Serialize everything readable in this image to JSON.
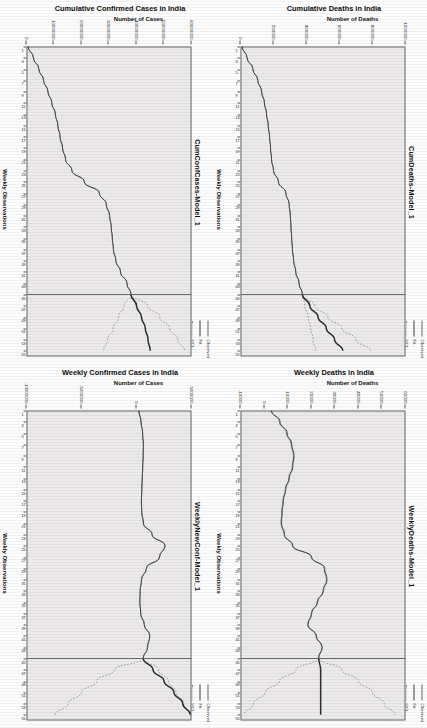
{
  "page": {
    "orientation": "rotated-90",
    "background": "#fdfdfd",
    "panel_fill": "#eceaea",
    "axis_color": "#6a6a6a",
    "observed_color": "#6b6b6b",
    "fit_color": "#3b3b3b",
    "limit_color": "#8a8a8a",
    "forecast_color": "#2b2b2b"
  },
  "legend": {
    "items": [
      {
        "label": "Observed",
        "style": "solid",
        "icon": "line-swatch-observed"
      },
      {
        "label": "Fit",
        "style": "solid",
        "icon": "line-swatch-fit"
      },
      {
        "label": "UCL",
        "style": "dotted",
        "icon": "line-swatch-ucl"
      },
      {
        "label": "LCL",
        "style": "dotted",
        "icon": "line-swatch-lcl"
      },
      {
        "label": "Forecast",
        "style": "thick-solid",
        "icon": "line-swatch-forecast"
      }
    ]
  },
  "chart_data": [
    {
      "id": "cum-conf-cases",
      "type": "line",
      "title": "CumConfCases-Model_1",
      "supertitle": "Cumulative Confirmed Cases in India",
      "xlabel": "Weekly Observations",
      "ylabel": "Number of Cases",
      "xlim": [
        1,
        56
      ],
      "ylim": [
        0,
        60000000
      ],
      "ytick_labels": [
        "0",
        "10000000",
        "20000000",
        "30000000",
        "40000000",
        "50000000",
        "60000000"
      ],
      "ytick_values": [
        0,
        10000000,
        20000000,
        30000000,
        40000000,
        50000000,
        60000000
      ],
      "xtick_labels": [
        "1",
        "3",
        "5",
        "7",
        "9",
        "11",
        "13",
        "15",
        "17",
        "19",
        "21",
        "23",
        "25",
        "27",
        "29",
        "31",
        "33",
        "35",
        "37",
        "39",
        "41",
        "43",
        "45",
        "47",
        "49",
        "51",
        "53",
        "55"
      ],
      "forecast_start": 45,
      "grid": false,
      "legend_position": "top-right",
      "series": [
        {
          "name": "Observed",
          "x": [
            1,
            3,
            5,
            7,
            9,
            11,
            13,
            15,
            17,
            19,
            21,
            23,
            25,
            27,
            29,
            31,
            33,
            35,
            37,
            39,
            41,
            43,
            45
          ],
          "values": [
            600000,
            2500000,
            4500000,
            6200000,
            7800000,
            9200000,
            10500000,
            11400000,
            12200000,
            13100000,
            14200000,
            16500000,
            21000000,
            26500000,
            29000000,
            30200000,
            30800000,
            31200000,
            31600000,
            32500000,
            34200000,
            36500000,
            38000000
          ]
        },
        {
          "name": "Fit",
          "x": [
            1,
            3,
            5,
            7,
            9,
            11,
            13,
            15,
            17,
            19,
            21,
            23,
            25,
            27,
            29,
            31,
            33,
            35,
            37,
            39,
            41,
            43,
            45
          ],
          "values": [
            600000,
            2500000,
            4500000,
            6200000,
            7800000,
            9200000,
            10500000,
            11400000,
            12200000,
            13100000,
            14200000,
            16500000,
            21000000,
            26500000,
            29000000,
            30200000,
            30800000,
            31200000,
            31600000,
            32500000,
            34200000,
            36500000,
            38000000
          ]
        },
        {
          "name": "Forecast",
          "x": [
            45,
            47,
            49,
            51,
            53,
            55
          ],
          "values": [
            38000000,
            40000000,
            41800000,
            43200000,
            44200000,
            45000000
          ]
        },
        {
          "name": "UCL",
          "x": [
            45,
            47,
            49,
            51,
            53,
            55
          ],
          "values": [
            38000000,
            44000000,
            48500000,
            52000000,
            55000000,
            57500000
          ]
        },
        {
          "name": "LCL",
          "x": [
            45,
            47,
            49,
            51,
            53,
            55
          ],
          "values": [
            38000000,
            35500000,
            33500000,
            31500000,
            29500000,
            28000000
          ]
        }
      ]
    },
    {
      "id": "cum-deaths",
      "type": "line",
      "title": "CumDeaths-Model_1",
      "supertitle": "Cumulative Deaths in India",
      "xlabel": "Weekly Observations",
      "ylabel": "Number of Deaths",
      "xlim": [
        1,
        56
      ],
      "ylim": [
        0,
        1000000
      ],
      "ytick_labels": [
        "0",
        "200000",
        "400000",
        "600000",
        "800000",
        "1000000"
      ],
      "ytick_values": [
        0,
        200000,
        400000,
        600000,
        800000,
        1000000
      ],
      "xtick_labels": [
        "1",
        "3",
        "5",
        "7",
        "9",
        "11",
        "13",
        "15",
        "17",
        "19",
        "21",
        "23",
        "25",
        "27",
        "29",
        "31",
        "33",
        "35",
        "37",
        "39",
        "41",
        "43",
        "45",
        "47",
        "49",
        "51",
        "53",
        "55"
      ],
      "forecast_start": 45,
      "grid": false,
      "legend_position": "top-right",
      "series": [
        {
          "name": "Observed",
          "x": [
            1,
            3,
            5,
            7,
            9,
            11,
            13,
            15,
            17,
            19,
            21,
            23,
            25,
            27,
            29,
            31,
            33,
            35,
            37,
            39,
            41,
            43,
            45
          ],
          "values": [
            10000,
            40000,
            75000,
            105000,
            128000,
            145000,
            158000,
            168000,
            176000,
            182000,
            188000,
            200000,
            230000,
            275000,
            295000,
            302000,
            306000,
            310000,
            315000,
            322000,
            335000,
            355000,
            375000
          ]
        },
        {
          "name": "Fit",
          "x": [
            1,
            3,
            5,
            7,
            9,
            11,
            13,
            15,
            17,
            19,
            21,
            23,
            25,
            27,
            29,
            31,
            33,
            35,
            37,
            39,
            41,
            43,
            45
          ],
          "values": [
            10000,
            40000,
            75000,
            105000,
            128000,
            145000,
            158000,
            168000,
            176000,
            182000,
            188000,
            200000,
            230000,
            275000,
            295000,
            302000,
            306000,
            310000,
            315000,
            322000,
            335000,
            355000,
            375000
          ]
        },
        {
          "name": "Forecast",
          "x": [
            45,
            47,
            49,
            51,
            53,
            55
          ],
          "values": [
            375000,
            420000,
            470000,
            520000,
            570000,
            620000
          ]
        },
        {
          "name": "UCL",
          "x": [
            45,
            47,
            49,
            51,
            53,
            55
          ],
          "values": [
            375000,
            450000,
            530000,
            615000,
            700000,
            790000
          ]
        },
        {
          "name": "LCL",
          "x": [
            45,
            47,
            49,
            51,
            53,
            55
          ],
          "values": [
            375000,
            390000,
            410000,
            425000,
            440000,
            455000
          ]
        }
      ]
    },
    {
      "id": "weekly-new-conf",
      "type": "line",
      "title": "WeeklyNewConf-Model_1",
      "supertitle": "Weekly Confirmed Cases in India",
      "xlabel": "Weekly Observations",
      "ylabel": "Number of Cases",
      "xlim": [
        1,
        56
      ],
      "ylim": [
        -10000000,
        5000000
      ],
      "ytick_labels": [
        "5000000",
        "0",
        "-5000000",
        "-10000000"
      ],
      "ytick_values": [
        5000000,
        0,
        -5000000,
        -10000000
      ],
      "xtick_labels": [
        "1",
        "3",
        "5",
        "7",
        "9",
        "11",
        "13",
        "15",
        "17",
        "19",
        "21",
        "23",
        "25",
        "27",
        "29",
        "31",
        "33",
        "35",
        "37",
        "39",
        "41",
        "43",
        "45",
        "47",
        "49",
        "51",
        "53",
        "55"
      ],
      "forecast_start": 45,
      "grid": false,
      "legend_position": "top-right",
      "series": [
        {
          "name": "Observed",
          "x": [
            1,
            3,
            5,
            7,
            9,
            11,
            13,
            15,
            17,
            19,
            21,
            23,
            25,
            27,
            29,
            31,
            33,
            35,
            37,
            39,
            41,
            43,
            45
          ],
          "values": [
            200000,
            400000,
            550000,
            620000,
            600000,
            560000,
            520000,
            480000,
            440000,
            470000,
            620000,
            1400000,
            2600000,
            2100000,
            900000,
            450000,
            330000,
            300000,
            380000,
            700000,
            1200000,
            1000000,
            600000
          ]
        },
        {
          "name": "Fit",
          "x": [
            1,
            3,
            5,
            7,
            9,
            11,
            13,
            15,
            17,
            19,
            21,
            23,
            25,
            27,
            29,
            31,
            33,
            35,
            37,
            39,
            41,
            43,
            45
          ],
          "values": [
            230000,
            420000,
            560000,
            630000,
            610000,
            570000,
            525000,
            485000,
            450000,
            480000,
            630000,
            1420000,
            2580000,
            2080000,
            905000,
            460000,
            335000,
            305000,
            385000,
            710000,
            1210000,
            1010000,
            610000
          ]
        },
        {
          "name": "Forecast",
          "x": [
            45,
            47,
            49,
            51,
            53,
            55
          ],
          "values": [
            610000,
            1500000,
            2500000,
            3400000,
            4200000,
            4900000
          ]
        },
        {
          "name": "UCL",
          "x": [
            45,
            47,
            49,
            51,
            53,
            55
          ],
          "values": [
            610000,
            2000000,
            2900000,
            3600000,
            4300000,
            4950000
          ]
        },
        {
          "name": "LCL",
          "x": [
            45,
            47,
            49,
            51,
            53,
            55
          ],
          "values": [
            610000,
            -2000000,
            -3600000,
            -5000000,
            -6200000,
            -7400000
          ]
        }
      ]
    },
    {
      "id": "weekly-deaths",
      "type": "line",
      "title": "WeeklyDeaths-Model_1",
      "supertitle": "Weekly Deaths in India",
      "xlabel": "Weekly Observations",
      "ylabel": "Number of Deaths",
      "xlim": [
        1,
        56
      ],
      "ylim": [
        -10000,
        60000
      ],
      "ytick_labels": [
        "60000",
        "50000",
        "40000",
        "30000",
        "20000",
        "10000",
        "0",
        "-10000"
      ],
      "ytick_values": [
        60000,
        50000,
        40000,
        30000,
        20000,
        10000,
        0,
        -10000
      ],
      "xtick_labels": [
        "1",
        "3",
        "5",
        "7",
        "9",
        "11",
        "13",
        "15",
        "17",
        "19",
        "21",
        "23",
        "25",
        "27",
        "29",
        "31",
        "33",
        "35",
        "37",
        "39",
        "41",
        "43",
        "45",
        "47",
        "49",
        "51",
        "53",
        "55"
      ],
      "forecast_start": 45,
      "grid": false,
      "legend_position": "top-right",
      "series": [
        {
          "name": "Observed",
          "x": [
            1,
            3,
            5,
            7,
            9,
            11,
            13,
            15,
            17,
            19,
            21,
            23,
            25,
            27,
            29,
            31,
            33,
            35,
            37,
            39,
            41,
            43,
            45
          ],
          "values": [
            3000,
            6500,
            9500,
            11500,
            12500,
            12000,
            10500,
            9000,
            8000,
            7500,
            7200,
            8500,
            12000,
            20000,
            25500,
            26500,
            25000,
            22500,
            20000,
            18500,
            22000,
            24500,
            23000
          ]
        },
        {
          "name": "Fit",
          "x": [
            1,
            3,
            5,
            7,
            9,
            11,
            13,
            15,
            17,
            19,
            21,
            23,
            25,
            27,
            29,
            31,
            33,
            35,
            37,
            39,
            41,
            43,
            45
          ],
          "values": [
            3200,
            6800,
            9800,
            11800,
            12700,
            12200,
            10700,
            9200,
            8200,
            7700,
            7400,
            8700,
            12200,
            20200,
            25700,
            26700,
            25200,
            22700,
            20200,
            18700,
            22200,
            24700,
            23200
          ]
        },
        {
          "name": "Forecast",
          "x": [
            45,
            47,
            49,
            51,
            53,
            55
          ],
          "values": [
            23200,
            24000,
            24000,
            24000,
            24000,
            24000
          ]
        },
        {
          "name": "UCL",
          "x": [
            45,
            47,
            49,
            51,
            53,
            55
          ],
          "values": [
            23200,
            33000,
            40000,
            46000,
            51000,
            55500
          ]
        },
        {
          "name": "LCL",
          "x": [
            45,
            47,
            49,
            51,
            53,
            55
          ],
          "values": [
            23200,
            13500,
            6500,
            500,
            -4500,
            -8500
          ]
        }
      ]
    }
  ]
}
